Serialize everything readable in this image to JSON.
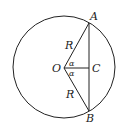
{
  "diagram": {
    "type": "geometry",
    "labels": {
      "A": "A",
      "B": "B",
      "C": "C",
      "O": "O",
      "R_top": "R",
      "R_bottom": "R",
      "alpha_top": "α",
      "alpha_bottom": "α"
    },
    "colors": {
      "stroke": "#222222",
      "background": "#ffffff"
    }
  }
}
